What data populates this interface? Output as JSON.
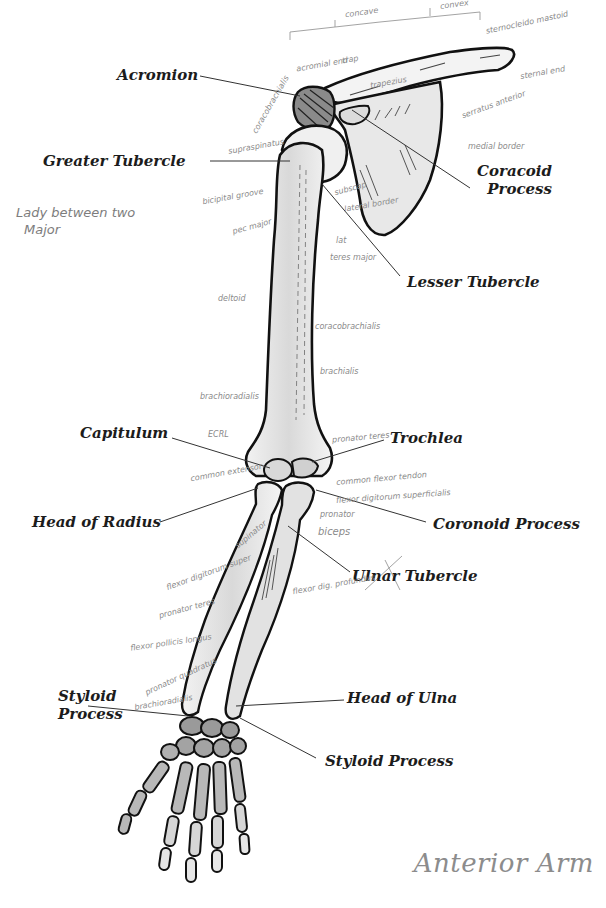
{
  "title": "Anterior Arm",
  "labels": {
    "acromion": "Acromion",
    "greater_tubercle": "Greater Tubercle",
    "coracoid_process_1": "Coracoid",
    "coracoid_process_2": "Process",
    "lesser_tubercle": "Lesser Tubercle",
    "capitulum": "Capitulum",
    "trochlea": "Trochlea",
    "head_of_radius": "Head of Radius",
    "coronoid_process": "Coronoid Process",
    "ulnar_tubercle": "Ulnar Tubercle",
    "styloid_process_radius_1": "Styloid",
    "styloid_process_radius_2": "Process",
    "head_of_ulna": "Head of Ulna",
    "styloid_process_ulna": "Styloid Process"
  },
  "handwritten_notes": {
    "mnemonic_1": "Lady between two",
    "mnemonic_2": "Major",
    "concave": "concave",
    "convex": "convex",
    "sternocleido": "sternocleido mastoid",
    "acromial_end": "acromial end",
    "trapezius": "trap",
    "trapezius_2": "trapezius",
    "sternal_end": "sternal end",
    "serratus_anterior": "serratus anterior",
    "medial_border": "medial border",
    "coracobrachialis_top": "coracobrachialis",
    "supraspinatus": "supraspinatus",
    "bicipital_groove": "bicipital groove",
    "pec_major": "pec major",
    "subscap": "subscap",
    "lateral_border": "lateral border",
    "lat": "lat",
    "teres_major": "teres major",
    "deltoid": "deltoid",
    "coracobrachialis": "coracobrachialis",
    "brachialis": "brachialis",
    "brachioradialis": "brachioradialis",
    "ecrl": "ECRL",
    "pronator_teres": "pronator teres",
    "common_extensor": "common extensor",
    "common_flexor_tendon": "common flexor tendon",
    "flexor_digitorum_superficialis": "flexor digitorum superficialis",
    "supinator": "supinator",
    "pronator": "pronator",
    "biceps": "biceps",
    "flexor_digitorum_super": "flexor digitorum super",
    "pronator_teres_2": "pronator teres",
    "flexor_digitorum_profundus": "flexor dig. profundus",
    "flexor_pollicis_longus": "flexor pollicis longus",
    "pronator_quadratus": "pronator quadratus",
    "brachioradialis_2": "brachioradialis"
  }
}
